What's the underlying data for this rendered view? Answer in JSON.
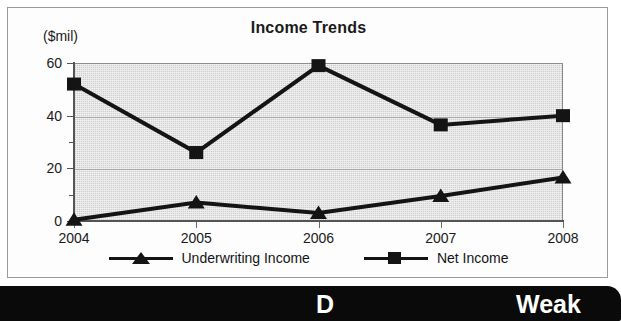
{
  "panel": {
    "units_label": "($mil)"
  },
  "chart_data": {
    "type": "line",
    "title": "Income Trends",
    "xlabel": "",
    "ylabel": "($mil)",
    "categories": [
      "2004",
      "2005",
      "2006",
      "2007",
      "2008"
    ],
    "ylim": [
      0,
      60
    ],
    "yticks": [
      0,
      20,
      40,
      60
    ],
    "yticks_minor": [
      10,
      30,
      50
    ],
    "ytick_labels": [
      "0",
      "20",
      "40",
      "60"
    ],
    "grid": true,
    "grid_axis": "y",
    "legend_position": "bottom",
    "plot_background": "#cfcfcf",
    "series": [
      {
        "name": "Underwriting Income",
        "marker": "triangle",
        "color": "#141414",
        "values": [
          0.5,
          7,
          3,
          9.5,
          16.5
        ]
      },
      {
        "name": "Net Income",
        "marker": "square",
        "color": "#141414",
        "values": [
          52,
          26,
          59,
          36.5,
          40
        ]
      }
    ]
  },
  "rating_bar": {
    "grade": "D",
    "descriptor": "Weak",
    "background": "#0a0a0a",
    "text_color": "#ffffff"
  }
}
